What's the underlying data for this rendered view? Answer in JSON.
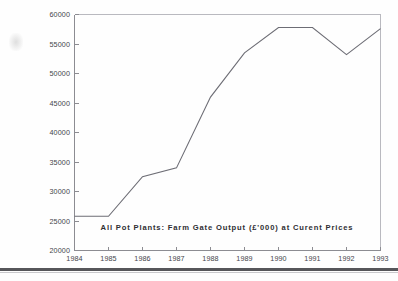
{
  "chart_data": {
    "type": "line",
    "title": "All  Pot  Plants:   Farm  Gate  Output  (£'000)  at  Curent  Prices",
    "title_raw": "All Pot Plants: Farm Gate Output (£'000) at Curent Prices",
    "xlabel": "",
    "ylabel": "",
    "x": [
      1984,
      1985,
      1986,
      1987,
      1988,
      1989,
      1990,
      1991,
      1992,
      1993
    ],
    "categories": [
      "1984",
      "1985",
      "1986",
      "1987",
      "1988",
      "1989",
      "1990",
      "1991",
      "1992",
      "1993"
    ],
    "values": [
      25800,
      25800,
      32500,
      34000,
      46000,
      53500,
      57800,
      57800,
      53200,
      57600
    ],
    "series": [
      {
        "name": "All Pot Plants: Farm Gate Output",
        "values": [
          25800,
          25800,
          32500,
          34000,
          46000,
          53500,
          57800,
          57800,
          53200,
          57600
        ]
      }
    ],
    "ylim": [
      20000,
      60000
    ],
    "xlim": [
      1984,
      1993
    ],
    "ytick_labels": [
      "20000",
      "25000",
      "30000",
      "35000",
      "40000",
      "45000",
      "50000",
      "55000",
      "60000"
    ],
    "ytick_values": [
      20000,
      25000,
      30000,
      35000,
      40000,
      45000,
      50000,
      55000,
      60000
    ],
    "xtick_labels": [
      "1984",
      "1985",
      "1986",
      "1987",
      "1988",
      "1989",
      "1990",
      "1991",
      "1992",
      "1993"
    ],
    "grid": false,
    "legend": null,
    "legend_position": "none",
    "line_color": "#6d6d75",
    "axis_color": "#8c8c92",
    "frame_color": "#b9b9bf",
    "text_color": "#44444a"
  },
  "figure": {
    "background": "#fefefe",
    "page_rule_color": "#56565a"
  }
}
